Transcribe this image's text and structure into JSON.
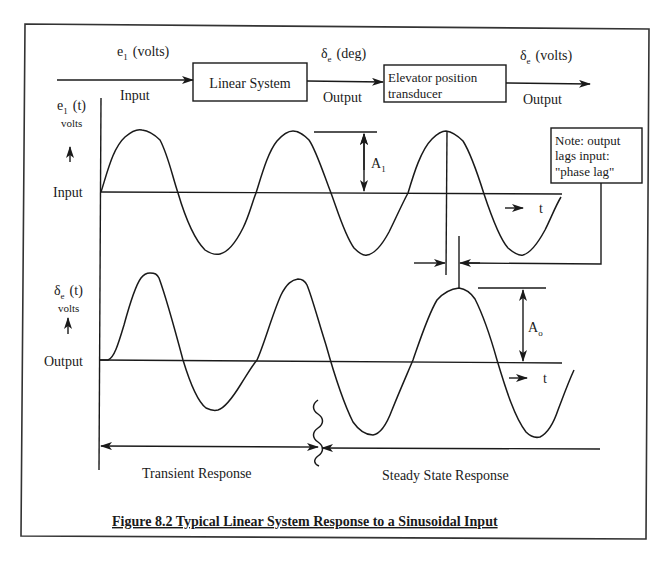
{
  "figure": {
    "caption": "Figure 8.2 Typical Linear System Response to a Sinusoidal Input",
    "colors": {
      "ink": "#1a1a1a",
      "background": "#ffffff",
      "frame": "#333333"
    }
  },
  "block_diagram": {
    "input_signal": {
      "symbol": "e",
      "subscript": "1",
      "unit": "(volts)",
      "label": "Input"
    },
    "block1": {
      "label": "Linear System"
    },
    "mid_signal": {
      "symbol": "δ",
      "subscript": "e",
      "unit": "(deg)",
      "label": "Output"
    },
    "block2": {
      "line1": "Elevator position",
      "line2": "transducer"
    },
    "output_signal": {
      "symbol": "δ",
      "subscript": "e",
      "unit": "(volts)",
      "label": "Output"
    }
  },
  "input_plot": {
    "axis_symbol": "e",
    "axis_subscript": "1",
    "axis_arg": "(t)",
    "axis_unit": "volts",
    "baseline_label": "Input",
    "time_label": "t",
    "amplitude_label": "A",
    "amplitude_subscript": "1"
  },
  "output_plot": {
    "axis_symbol": "δ",
    "axis_subscript": "e",
    "axis_arg": "(t)",
    "axis_unit": "volts",
    "baseline_label": "Output",
    "time_label": "t",
    "amplitude_label": "A",
    "amplitude_subscript": "o"
  },
  "note": {
    "line1": "Note: output",
    "line2": "lags input:",
    "line3": "\"phase lag\""
  },
  "regions": {
    "transient": "Transient Response",
    "steady_state": "Steady State Response"
  }
}
